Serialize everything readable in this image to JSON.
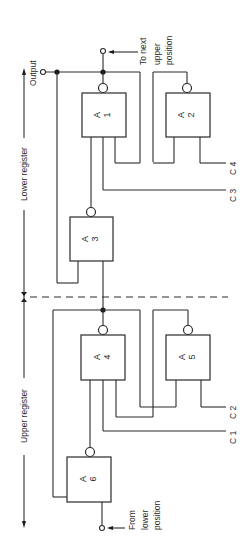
{
  "figure": {
    "labels": {
      "output": "Output",
      "to_next_upper": [
        "To next",
        "upper",
        "position"
      ],
      "from_lower": [
        "From",
        "lower",
        "position"
      ],
      "lower_register": "Lower register",
      "upper_register": "Upper register"
    },
    "gates": [
      {
        "id": "A1",
        "letter": "A",
        "number": "1"
      },
      {
        "id": "A2",
        "letter": "A",
        "number": "2"
      },
      {
        "id": "A3",
        "letter": "A",
        "number": "3"
      },
      {
        "id": "A4",
        "letter": "A",
        "number": "4"
      },
      {
        "id": "A5",
        "letter": "A",
        "number": "5"
      },
      {
        "id": "A6",
        "letter": "A",
        "number": "6"
      }
    ],
    "control_inputs": {
      "c1": "C 1",
      "c2": "C 2",
      "c3": "C 3",
      "c4": "C 4"
    },
    "colors": {
      "line": "#2a2a2a",
      "background": "#ffffff"
    }
  }
}
